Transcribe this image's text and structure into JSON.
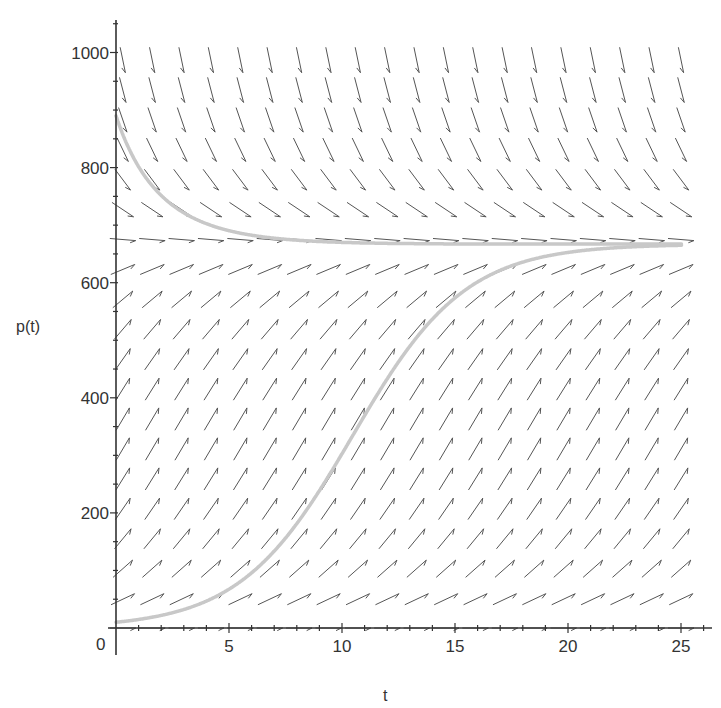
{
  "chart_data": {
    "type": "line",
    "subtype": "direction-field-with-solution-curves",
    "title": "",
    "xlabel": "t",
    "ylabel": "p(t)",
    "xlim": [
      0,
      26
    ],
    "ylim": [
      0,
      1050
    ],
    "x_ticks": [
      0,
      5,
      10,
      15,
      20,
      25
    ],
    "y_ticks": [
      200,
      400,
      600,
      800,
      1000
    ],
    "origin_label": "0",
    "grid": false,
    "legend": null,
    "model": {
      "equation": "dp/dt = r*p*(1 - p/K)",
      "r": 0.4,
      "K": 667
    },
    "field": {
      "t_values": [
        0.3,
        1.6,
        2.9,
        4.2,
        5.5,
        6.8,
        8.1,
        9.4,
        10.7,
        12.0,
        13.3,
        14.6,
        15.9,
        17.2,
        18.5,
        19.8,
        21.1,
        22.4,
        23.7,
        25.0
      ],
      "p_values": [
        0,
        50,
        103,
        155,
        207,
        259,
        311,
        363,
        415,
        467,
        519,
        571,
        623,
        675,
        727,
        779,
        831,
        883,
        935,
        987
      ],
      "arrow_color": "#555555"
    },
    "series": [
      {
        "name": "solution p(0)=10",
        "color": "#c8c8c8",
        "t": [
          0,
          1,
          2,
          3,
          4,
          5,
          6,
          7,
          8,
          9,
          10,
          11,
          12,
          13,
          14,
          15,
          16,
          17,
          18,
          19,
          20,
          21,
          22,
          23,
          24,
          25
        ],
        "p": [
          10,
          15,
          22,
          32,
          47,
          68,
          97,
          136,
          185,
          243,
          306,
          368,
          425,
          475,
          516,
          550,
          576,
          596,
          612,
          624,
          636,
          645,
          652,
          657,
          661,
          664
        ]
      },
      {
        "name": "solution p(0)=890",
        "color": "#c8c8c8",
        "t": [
          0,
          1,
          2,
          3,
          4,
          5,
          6,
          7,
          8,
          9,
          10,
          11,
          12,
          13,
          14,
          15,
          16,
          17,
          18,
          19,
          20,
          21,
          22,
          23,
          24,
          25
        ],
        "p": [
          890,
          790,
          732,
          700,
          684,
          676,
          672,
          669,
          668,
          667.5,
          667,
          667,
          667,
          667,
          667,
          667,
          667,
          667,
          667,
          667,
          667,
          667,
          667,
          667,
          667,
          667
        ]
      }
    ]
  },
  "axes": {
    "xlabel": "t",
    "ylabel": "p(t)",
    "origin": "0",
    "x_tick_labels": [
      "5",
      "10",
      "15",
      "20",
      "25"
    ],
    "y_tick_labels": [
      "200",
      "400",
      "600",
      "800",
      "1000"
    ]
  }
}
